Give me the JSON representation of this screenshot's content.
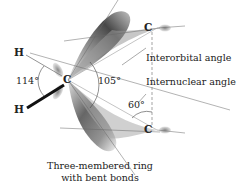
{
  "diagram": {
    "atoms": {
      "h_top": "H",
      "h_bottom": "H",
      "c_left": "C",
      "c_top_right": "C",
      "c_bottom_right": "C"
    },
    "angles": {
      "hch": "114°",
      "interorbital": "105°",
      "internuclear": "60°"
    },
    "labels": {
      "interorbital": "Interorbital angle",
      "internuclear": "Internuclear angle"
    },
    "caption": {
      "line1": "Three-membered ring",
      "line2": "with bent bonds"
    },
    "colors": {
      "text": "#222222",
      "lobe_dark": "#3a3a3a",
      "lobe_light": "#d8d8d8",
      "line": "#555555"
    }
  }
}
